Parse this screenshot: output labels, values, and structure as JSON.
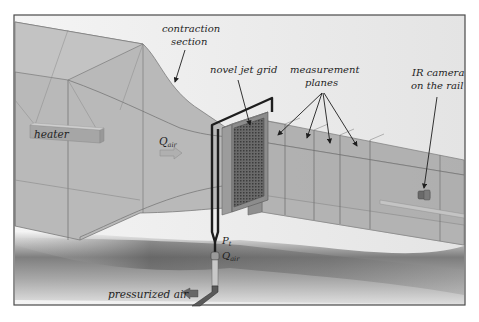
{
  "diagram": {
    "type": "wind-tunnel-schematic",
    "labels": {
      "contraction_line1": "contraction",
      "contraction_line2": "section",
      "jet_grid": "novel jet grid",
      "measurement_line1": "measurement",
      "measurement_line2": "planes",
      "ir_line1": "IR camera",
      "ir_line2": "on the rail",
      "heater": "heater",
      "q_flow": "Q",
      "q_flow_sub": "air",
      "p_t": "P",
      "p_t_sub": "t",
      "q_jet": "Q",
      "q_jet_sub": "air",
      "pressurized_air": "pressurized air"
    },
    "measurement_plane_count": 4,
    "colors": {
      "frame": "#4a4a4a",
      "tunnel_fill": "#b8b8b8",
      "tunnel_edge": "#6e6e6e",
      "pipe": "#1e1e1e",
      "grid": "#555555",
      "background": "#ffffff"
    }
  }
}
